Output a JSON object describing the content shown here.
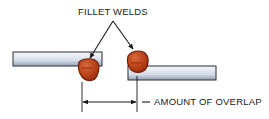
{
  "figure": {
    "type": "engineering-diagram",
    "background_color": "#ffffff"
  },
  "labels": {
    "fillet_welds": "FILLET WELDS",
    "amount_of_overlap": "AMOUNT OF OVERLAP"
  },
  "colors": {
    "plate_light": "#eef1f6",
    "plate_mid": "#ced6e3",
    "plate_dark": "#8e9bb0",
    "plate_outline": "#3c3f45",
    "weld_fill_light": "#d4562a",
    "weld_fill_dark": "#a8300f",
    "weld_outline": "#6e1d08",
    "line_color": "#1a1a1a",
    "text_color": "#1a1a1a"
  },
  "parts": {
    "upper_plate": {
      "name": "upper plate",
      "x": 13,
      "y": 52,
      "width": 89,
      "height": 14
    },
    "lower_plate": {
      "name": "lower plate",
      "x": 128,
      "y": 66,
      "width": 88,
      "height": 14
    },
    "weld_left": {
      "name": "left fillet weld bead",
      "cx": 88,
      "cy": 70,
      "rx": 11,
      "ry": 12
    },
    "weld_right": {
      "name": "right fillet weld bead",
      "cx": 137,
      "cy": 62,
      "rx": 11,
      "ry": 11
    }
  },
  "annotations": {
    "leader_apex": {
      "x": 113,
      "y": 21
    },
    "leader_left_tip": {
      "x": 90,
      "y": 58
    },
    "leader_right_tip": {
      "x": 133,
      "y": 49
    },
    "dimension": {
      "left_extension_x": 82,
      "right_extension_x": 137,
      "line_y": 102,
      "extension_top_y": 82,
      "extension_bottom_y": 112,
      "leader_dash_from_x": 142,
      "leader_dash_to_x": 150,
      "text_x": 154,
      "text_y": 105
    },
    "fillet_welds_text": {
      "x": 113,
      "y": 15
    }
  }
}
